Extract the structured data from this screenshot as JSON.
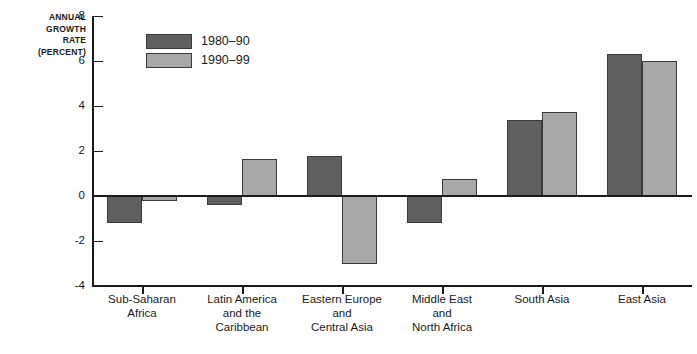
{
  "chart_data": {
    "type": "bar",
    "title": "",
    "subtitle": "",
    "xlabel": "",
    "ylabel": "ANNUAL GROWTH RATE (PERCENT)",
    "ylabel_lines": [
      "ANNUAL",
      "GROWTH",
      "RATE",
      "(PERCENT)"
    ],
    "ylim": [
      -4,
      8
    ],
    "ytick_values": [
      -4,
      -2,
      0,
      2,
      4,
      6,
      8
    ],
    "ytick_labels": [
      "-4",
      "-2",
      "0",
      "2",
      "4",
      "6",
      "8"
    ],
    "grid": false,
    "legend_position": "top-left",
    "categories": [
      "Sub-Saharan Africa",
      "Latin America and the Caribbean",
      "Eastern Europe and Central Asia",
      "Middle East and North Africa",
      "South Asia",
      "East Asia"
    ],
    "category_label_lines": [
      [
        "Sub-Saharan",
        "Africa"
      ],
      [
        "Latin America",
        "and the",
        "Caribbean"
      ],
      [
        "Eastern Europe",
        "and",
        "Central Asia"
      ],
      [
        "Middle East",
        "and",
        "North Africa"
      ],
      [
        "South Asia"
      ],
      [
        "East Asia"
      ]
    ],
    "series": [
      {
        "name": "1980–90",
        "color": "#5f5f5f",
        "values": [
          -1.2,
          -0.4,
          1.8,
          -1.2,
          3.4,
          6.3
        ]
      },
      {
        "name": "1990–99",
        "color": "#a8a8a8",
        "values": [
          -0.2,
          1.65,
          -3.0,
          0.75,
          3.75,
          6.0
        ]
      }
    ]
  },
  "legend": {
    "items": [
      {
        "label": "1980–90",
        "color": "#5f5f5f"
      },
      {
        "label": "1990–99",
        "color": "#a8a8a8"
      }
    ]
  },
  "colors": {
    "series_1980_90": "#5f5f5f",
    "series_1990_99": "#a8a8a8",
    "axis": "#1a1a1a",
    "background": "#ffffff"
  }
}
